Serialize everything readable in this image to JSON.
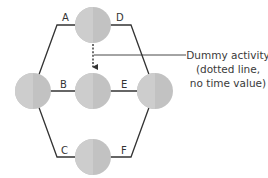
{
  "diagram": {
    "type": "network-activity-diagram",
    "activities": [
      {
        "label": "A",
        "from": "left",
        "to": "top"
      },
      {
        "label": "D",
        "from": "top",
        "to": "right"
      },
      {
        "label": "B",
        "from": "left",
        "to": "center"
      },
      {
        "label": "E",
        "from": "center",
        "to": "right"
      },
      {
        "label": "C",
        "from": "left",
        "to": "bottom"
      },
      {
        "label": "F",
        "from": "bottom",
        "to": "right"
      }
    ],
    "dummy_activity": {
      "from": "top",
      "to": "center",
      "style": "dotted"
    },
    "nodes": [
      "left",
      "top",
      "center",
      "bottom",
      "right"
    ],
    "annotation": {
      "line1": "Dummy activity",
      "line2": "(dotted line,",
      "line3": "no time value)"
    },
    "colors": {
      "node_fill": "#c8c8c8",
      "edge": "#333333",
      "text": "#3a3a3a",
      "background": "#ffffff"
    }
  }
}
